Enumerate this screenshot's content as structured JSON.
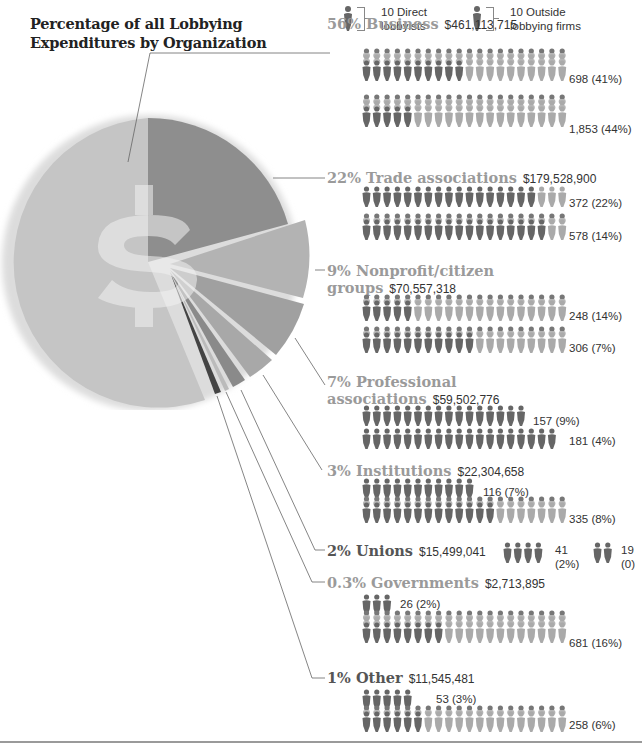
{
  "title": {
    "line1": "Percentage of all Lobbying",
    "line2": "Expenditures by Organization"
  },
  "legend": {
    "direct": {
      "line1": "10 Direct",
      "line2": "lobbyists",
      "icon": "person-dark-icon"
    },
    "outside": {
      "line1": "10 Outside",
      "line2": "lobbying firms",
      "icon": "person-light-head-icon"
    }
  },
  "colors": {
    "dark_figure": "#666666",
    "light_figure": "#aaaaaa",
    "label_gray": "#9a9a9a",
    "pie_business": "#c3c3c3",
    "pie_trade": "#8e8e8e",
    "pie_nonprofit": "#b0b0b0"
  },
  "categories": [
    {
      "pct": "56%",
      "name": "Business",
      "amount": "$461,113,715",
      "direct": "698 (41%)",
      "outside": "1,853 (44%)"
    },
    {
      "pct": "22%",
      "name": "Trade associations",
      "amount": "$179,528,900",
      "direct": "372 (22%)",
      "outside": "578 (14%)"
    },
    {
      "pct": "9%",
      "name": "Nonprofit/citizen",
      "name2": "groups",
      "amount": "$70,557,318",
      "direct": "248 (14%)",
      "outside": "306 (7%)"
    },
    {
      "pct": "7%",
      "name": "Professional",
      "name2": "associations",
      "amount": "$59,502,776",
      "direct": "157 (9%)",
      "outside": "181 (4%)"
    },
    {
      "pct": "3%",
      "name": "Institutions",
      "amount": "$22,304,658",
      "direct": "116 (7%)",
      "outside": "335 (8%)"
    },
    {
      "pct": "2%",
      "name": "Unions",
      "amount": "$15,499,041",
      "direct_num": "41",
      "direct_pct": "(2%)",
      "outside_num": "19",
      "outside_pct": "(0)"
    },
    {
      "pct": "0.3%",
      "name": "Governments",
      "amount": "$2,713,895",
      "direct": "26 (2%)",
      "outside": "681 (16%)"
    },
    {
      "pct": "1%",
      "name": "Other",
      "amount": "$11,545,481",
      "direct": "53 (3%)",
      "outside": "258 (6%)"
    }
  ],
  "chart_data": {
    "type": "pie",
    "title": "Percentage of all Lobbying Expenditures by Organization",
    "categories": [
      "Business",
      "Trade associations",
      "Nonprofit/citizen groups",
      "Professional associations",
      "Institutions",
      "Unions",
      "Governments",
      "Other"
    ],
    "values": [
      56,
      22,
      9,
      7,
      3,
      2,
      0.3,
      1
    ],
    "amounts_usd": [
      461113715,
      179528900,
      70557318,
      59502776,
      22304658,
      15499041,
      2713895,
      11545481
    ],
    "direct_lobbyists": [
      698,
      372,
      248,
      157,
      116,
      41,
      26,
      53
    ],
    "direct_lobbyists_pct": [
      41,
      22,
      14,
      9,
      7,
      2,
      2,
      3
    ],
    "outside_firms": [
      1853,
      578,
      306,
      181,
      335,
      19,
      681,
      258
    ],
    "outside_firms_pct": [
      44,
      14,
      7,
      4,
      8,
      0,
      16,
      6
    ],
    "legend": [
      "10 Direct lobbyists",
      "10 Outside lobbying firms"
    ],
    "center_symbol": "$"
  }
}
